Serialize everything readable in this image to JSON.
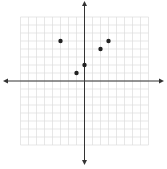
{
  "chart_data": {
    "type": "scatter",
    "title": "",
    "xlabel": "",
    "ylabel": "",
    "xlim": [
      -8,
      8
    ],
    "ylim": [
      -8,
      8
    ],
    "grid": true,
    "legend": null,
    "series": [
      {
        "name": "points",
        "points": [
          {
            "x": -3,
            "y": 5
          },
          {
            "x": 3,
            "y": 5
          },
          {
            "x": 2,
            "y": 4
          },
          {
            "x": 0,
            "y": 2
          },
          {
            "x": -1,
            "y": 1
          }
        ]
      }
    ]
  },
  "style": {
    "grid_color": "#dcdcdc",
    "axis_color": "#333333",
    "point_color": "#222222",
    "background": "#ffffff"
  }
}
